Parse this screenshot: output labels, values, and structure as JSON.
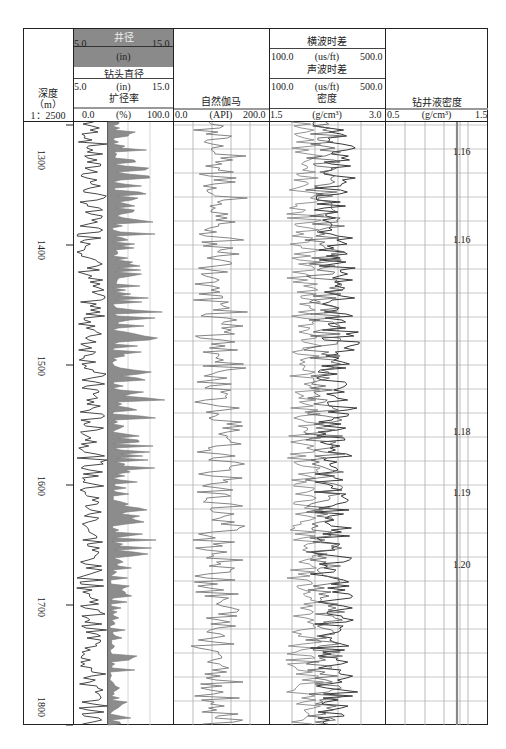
{
  "chart_data": {
    "type": "well-log",
    "title": "",
    "depth_track": {
      "label": "深度",
      "unit": "（m）",
      "scale": "1：2500",
      "ticks": [
        1300,
        1400,
        1500,
        1600,
        1700,
        1800
      ],
      "range": [
        1298,
        1800
      ]
    },
    "tracks": [
      {
        "name": "caliper-track",
        "curves": [
          {
            "name": "井径",
            "unit": "(in)",
            "min": "5.0",
            "max": "15.0",
            "style": "dark line, gray header"
          },
          {
            "name": "钻头直径",
            "unit": "(in)",
            "min": "5.0",
            "max": "15.0",
            "style": "straight line"
          },
          {
            "name": "扩径率",
            "unit": "(%)",
            "min": "0.0",
            "max": "100.0",
            "style": "gray fill"
          }
        ]
      },
      {
        "name": "gamma-ray-track",
        "curves": [
          {
            "name": "自然伽马",
            "unit": "(API)",
            "min": "0.0",
            "max": "200.0",
            "style": "gray line"
          }
        ]
      },
      {
        "name": "sonic-density-track",
        "curves": [
          {
            "name": "横波时差",
            "unit": "(us/ft)",
            "min": "100.0",
            "max": "500.0"
          },
          {
            "name": "声波时差",
            "unit": "(us/ft)",
            "min": "100.0",
            "max": "500.0"
          },
          {
            "name": "密度",
            "unit": "(g/cm³)",
            "min": "1.5",
            "max": "3.0"
          }
        ]
      },
      {
        "name": "mud-density-track",
        "curves": [
          {
            "name": "钻井液密度",
            "unit": "(g/cm³)",
            "min": "0.5",
            "max": "1.5"
          }
        ],
        "annotations": [
          {
            "depth": 1302,
            "value": "1.16"
          },
          {
            "depth": 1395,
            "value": "1.16"
          },
          {
            "depth": 1557,
            "value": "1.18"
          },
          {
            "depth": 1608,
            "value": "1.19"
          },
          {
            "depth": 1667,
            "value": "1.20"
          }
        ]
      }
    ]
  },
  "header": {
    "depth": {
      "label": "深度",
      "unit": "（m）",
      "scale": "1：2500"
    },
    "caliper": {
      "name": "井径",
      "min": "5.0",
      "unit": "(in)",
      "max": "15.0"
    },
    "bit": {
      "name": "钻头直径",
      "min": "5.0",
      "unit": "(in)",
      "max": "15.0"
    },
    "er": {
      "name": "扩径率",
      "min": "0.0",
      "unit": "(%)",
      "max": "100.0"
    },
    "gr": {
      "name": "自然伽马",
      "min": "0.0",
      "unit": "(API)",
      "max": "200.0"
    },
    "shear": {
      "name": "横波时差",
      "min": "100.0",
      "unit": "(us/ft)",
      "max": "500.0"
    },
    "sonic": {
      "name": "声波时差",
      "min": "100.0",
      "unit": "(us/ft)",
      "max": "500.0"
    },
    "den": {
      "name": "密度",
      "min": "1.5",
      "unit": "(g/cm³)",
      "max": "3.0"
    },
    "mud": {
      "name": "钻井液密度",
      "min": "0.5",
      "unit": "(g/cm³)",
      "max": "1.5"
    }
  },
  "depth_labels": [
    "1300",
    "1400",
    "1500",
    "1600",
    "1700",
    "1800"
  ],
  "mud_labels": [
    "1.16",
    "1.16",
    "1.18",
    "1.19",
    "1.20"
  ]
}
